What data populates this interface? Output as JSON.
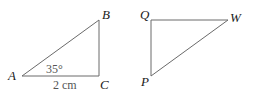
{
  "triangle_abc": {
    "vertices": {
      "A": "A",
      "B": "B",
      "C": "C"
    },
    "angle_label": "35°",
    "side_label": "2 cm"
  },
  "triangle_pqw": {
    "vertices": {
      "Q": "Q",
      "W": "W",
      "P": "P"
    }
  },
  "colors": {
    "line": "#6a6a6a",
    "text": "#1a1a1a",
    "measure": "#555555"
  }
}
